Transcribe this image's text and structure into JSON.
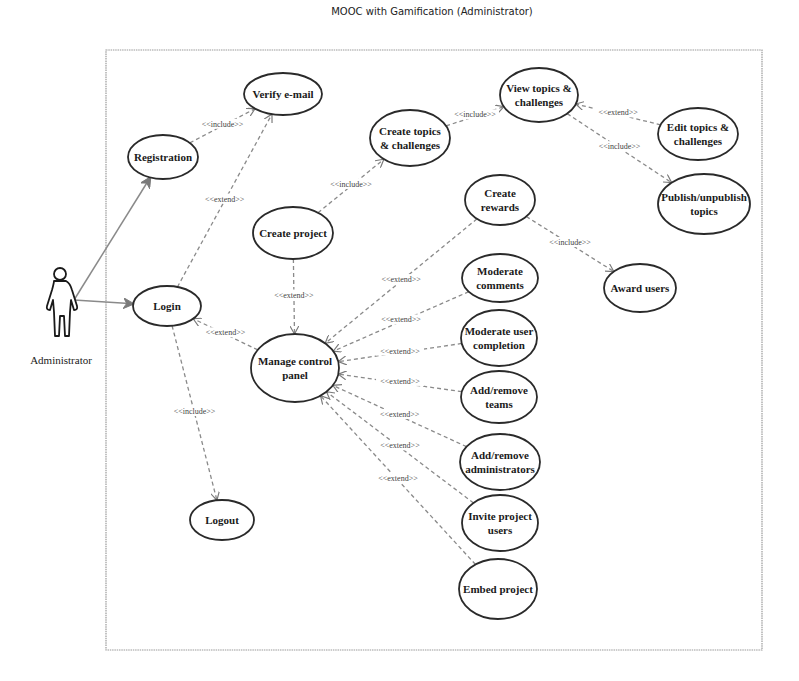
{
  "diagram": {
    "title": "MOOC with Gamification (Administrator)",
    "type": "UML use case diagram",
    "actor": {
      "id": "admin",
      "label": "Administrator"
    },
    "use_cases": [
      {
        "id": "registration",
        "lines": [
          "Registration"
        ],
        "cx": 163,
        "cy": 157,
        "rx": 35,
        "ry": 22
      },
      {
        "id": "verify",
        "lines": [
          "Verify e-mail"
        ],
        "cx": 283,
        "cy": 94,
        "rx": 39,
        "ry": 21
      },
      {
        "id": "create_topics",
        "lines": [
          "Create topics",
          "& challenges"
        ],
        "cx": 410,
        "cy": 138,
        "rx": 40,
        "ry": 28
      },
      {
        "id": "view_topics",
        "lines": [
          "View topics &",
          "challenges"
        ],
        "cx": 539,
        "cy": 95,
        "rx": 39,
        "ry": 27
      },
      {
        "id": "edit_topics",
        "lines": [
          "Edit topics &",
          "challenges"
        ],
        "cx": 698,
        "cy": 134,
        "rx": 40,
        "ry": 26
      },
      {
        "id": "publish",
        "lines": [
          "Publish/unpublish",
          "topics"
        ],
        "cx": 704,
        "cy": 204,
        "rx": 46,
        "ry": 30
      },
      {
        "id": "create_project",
        "lines": [
          "Create project"
        ],
        "cx": 293,
        "cy": 233,
        "rx": 40,
        "ry": 26
      },
      {
        "id": "create_rewards",
        "lines": [
          "Create",
          "rewards"
        ],
        "cx": 500,
        "cy": 200,
        "rx": 35,
        "ry": 25
      },
      {
        "id": "award_users",
        "lines": [
          "Award users"
        ],
        "cx": 640,
        "cy": 288,
        "rx": 36,
        "ry": 24
      },
      {
        "id": "login",
        "lines": [
          "Login"
        ],
        "cx": 167,
        "cy": 306,
        "rx": 34,
        "ry": 20
      },
      {
        "id": "manage_panel",
        "lines": [
          "Manage control",
          "panel"
        ],
        "cx": 295,
        "cy": 368,
        "rx": 44,
        "ry": 34
      },
      {
        "id": "mod_comments",
        "lines": [
          "Moderate",
          "comments"
        ],
        "cx": 500,
        "cy": 278,
        "rx": 38,
        "ry": 24
      },
      {
        "id": "mod_completion",
        "lines": [
          "Moderate user",
          "completion"
        ],
        "cx": 499,
        "cy": 338,
        "rx": 38,
        "ry": 28
      },
      {
        "id": "teams",
        "lines": [
          "Add/remove",
          "teams"
        ],
        "cx": 499,
        "cy": 397,
        "rx": 38,
        "ry": 26
      },
      {
        "id": "admins",
        "lines": [
          "Add/remove",
          "administrators"
        ],
        "cx": 500,
        "cy": 462,
        "rx": 40,
        "ry": 28
      },
      {
        "id": "invite",
        "lines": [
          "Invite project",
          "users"
        ],
        "cx": 500,
        "cy": 523,
        "rx": 38,
        "ry": 28
      },
      {
        "id": "embed",
        "lines": [
          "Embed project"
        ],
        "cx": 498,
        "cy": 589,
        "rx": 39,
        "ry": 30
      },
      {
        "id": "logout",
        "lines": [
          "Logout"
        ],
        "cx": 222,
        "cy": 520,
        "rx": 32,
        "ry": 20
      }
    ],
    "associations": [
      {
        "from": "admin",
        "to": "registration"
      },
      {
        "from": "admin",
        "to": "login"
      }
    ],
    "relationships": [
      {
        "from": "registration",
        "to": "verify",
        "stereotype": "<<include>>"
      },
      {
        "from": "login",
        "to": "verify",
        "stereotype": "<<extend>>"
      },
      {
        "from": "create_project",
        "to": "create_topics",
        "stereotype": "<<include>>"
      },
      {
        "from": "create_topics",
        "to": "view_topics",
        "stereotype": "<<include>>"
      },
      {
        "from": "edit_topics",
        "to": "view_topics",
        "stereotype": "<<extend>>"
      },
      {
        "from": "view_topics",
        "to": "publish",
        "stereotype": "<<include>>"
      },
      {
        "from": "create_rewards",
        "to": "award_users",
        "stereotype": "<<include>>"
      },
      {
        "from": "create_project",
        "to": "manage_panel",
        "stereotype": "<<extend>>"
      },
      {
        "from": "manage_panel",
        "to": "login",
        "stereotype": "<<extend>>"
      },
      {
        "from": "login",
        "to": "logout",
        "stereotype": "<<include>>"
      },
      {
        "from": "create_rewards",
        "to": "manage_panel",
        "stereotype": "<<extend>>"
      },
      {
        "from": "mod_comments",
        "to": "manage_panel",
        "stereotype": "<<extend>>"
      },
      {
        "from": "mod_completion",
        "to": "manage_panel",
        "stereotype": "<<extend>>"
      },
      {
        "from": "teams",
        "to": "manage_panel",
        "stereotype": "<<extend>>"
      },
      {
        "from": "admins",
        "to": "manage_panel",
        "stereotype": "<<extend>>"
      },
      {
        "from": "invite",
        "to": "manage_panel",
        "stereotype": "<<extend>>"
      },
      {
        "from": "embed",
        "to": "manage_panel",
        "stereotype": "<<extend>>"
      }
    ]
  }
}
